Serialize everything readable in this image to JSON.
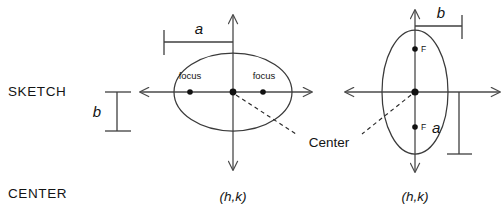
{
  "diagram": {
    "type": "geometry-diagram",
    "row_labels": {
      "sketch": "SKETCH",
      "center": "CENTER"
    },
    "shared_labels": {
      "center_callout": "Center"
    },
    "figures": [
      {
        "id": "horizontal-ellipse",
        "orientation": "horizontal",
        "center_value": "(h,k)",
        "semi_major_label": "a",
        "semi_minor_label": "b",
        "focus_labels": [
          "focus",
          "focus"
        ],
        "focus_count": 2,
        "axis_arrows": [
          "left",
          "right",
          "up",
          "down"
        ]
      },
      {
        "id": "vertical-ellipse",
        "orientation": "vertical",
        "center_value": "(h,k)",
        "semi_major_label": "a",
        "semi_minor_label": "b",
        "focus_labels": [
          "F",
          "F"
        ],
        "focus_count": 2,
        "axis_arrows": [
          "left",
          "right",
          "up",
          "down"
        ]
      }
    ],
    "colors": {
      "ink": "#141414",
      "curve": "#3a3a3a",
      "axis": "#4a4a4a",
      "dash": "#2b2b2b",
      "background": "#ffffff"
    }
  }
}
